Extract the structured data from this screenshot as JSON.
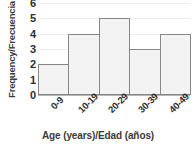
{
  "chart_data": {
    "type": "bar",
    "title": "",
    "categories": [
      "0-9",
      "10-19",
      "20-29",
      "30-39",
      "40-49"
    ],
    "values": [
      2,
      4,
      5,
      3,
      4
    ],
    "xlabel": "Age (years)/Edad (años)",
    "ylabel": "Frequency/Frecuencia",
    "ylim": [
      0,
      6
    ],
    "yticks": [
      0,
      1,
      2,
      3,
      4,
      5,
      6
    ],
    "ytick_labels": [
      "0",
      "1",
      "2",
      "3",
      "4",
      "5",
      "6"
    ],
    "grid": true,
    "legend": false,
    "bar_fill_color": "#f3f3f3",
    "bar_edge_color": "#878787",
    "gridline_color": "#ededed",
    "axis_color": "#b6b6b6",
    "text_color": "#2f2f2f",
    "background_color": "#ffffff"
  }
}
